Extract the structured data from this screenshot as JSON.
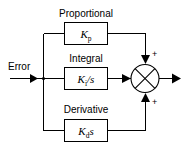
{
  "diagram": {
    "input": {
      "label": "Error"
    },
    "branches": [
      {
        "id": "proportional",
        "caption": "Proportional",
        "gain_var": "K",
        "gain_sub": "p",
        "gain_suffix": "",
        "gain_text": "Kp"
      },
      {
        "id": "integral",
        "caption": "Integral",
        "gain_var": "K",
        "gain_sub": "i",
        "gain_suffix": "/s",
        "gain_text": "Ki/s"
      },
      {
        "id": "derivative",
        "caption": "Derivative",
        "gain_var": "K",
        "gain_sub": "d",
        "gain_suffix": "s",
        "gain_text": "Kds"
      }
    ],
    "summing_junction": {
      "symbol": "X",
      "sign_top": "+",
      "sign_middle": "",
      "sign_bottom": "+"
    },
    "colors": {
      "line": "#000000",
      "background": "#ffffff",
      "text": "#000000"
    }
  }
}
